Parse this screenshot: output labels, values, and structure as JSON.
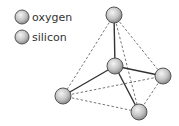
{
  "legend": {
    "items": [
      {
        "label": "oxygen"
      },
      {
        "label": "silicon"
      }
    ]
  },
  "diagram": {
    "type": "tetrahedral molecule model",
    "atoms": [
      "top oxygen",
      "center silicon",
      "right oxygen",
      "left oxygen",
      "bottom oxygen"
    ],
    "colors": {
      "sphere_fill": "#c8c8c8",
      "sphere_stroke": "#555555",
      "bond": "#333333",
      "dashed_edge": "#666666"
    }
  }
}
